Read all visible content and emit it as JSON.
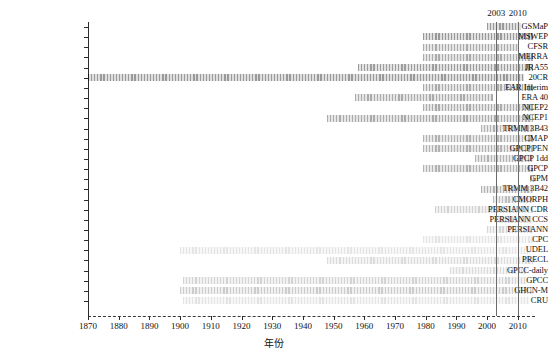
{
  "chart_data": {
    "type": "bar",
    "subtype": "gantt-timeline",
    "title": "",
    "xlabel": "年份",
    "ylabel": "",
    "xlim": [
      1870,
      2016
    ],
    "xticks": [
      1870,
      1880,
      1890,
      1900,
      1910,
      1920,
      1930,
      1940,
      1950,
      1960,
      1970,
      1980,
      1990,
      2000,
      2010
    ],
    "xticklabels": [
      "1870",
      "1880",
      "1890",
      "1900",
      "1910",
      "1920",
      "1930",
      "1940",
      "1950",
      "1960",
      "1970",
      "1980",
      "1990",
      "2000",
      "2010"
    ],
    "grid": false,
    "legend": null,
    "annotations": [
      {
        "label": "2003",
        "x": 2003,
        "type": "vertical-line"
      },
      {
        "label": "2010",
        "x": 2010,
        "type": "vertical-line"
      }
    ],
    "categories": [
      "GSMaP",
      "MSWEP",
      "CFSR",
      "MERRA",
      "JRA55",
      "20CR",
      "EAR Interim",
      "ERA 40",
      "NCEP2",
      "NCEP1",
      "TRMM 3B43",
      "CMAP",
      "GPCP PEN",
      "GPCP 1dd",
      "GPCP",
      "GPM",
      "TRMM 3B42",
      "CMORPH",
      "PERSIANN CDR",
      "PERSIANN CCS",
      "PERSIANN",
      "CPC",
      "UDEL",
      "PRECL",
      "GPCC-daily",
      "GPCC",
      "GHCN-M",
      "CRU"
    ],
    "bars": [
      {
        "name": "GSMaP",
        "start": 2000,
        "end": 2011,
        "shade": 0.4
      },
      {
        "name": "MSWEP",
        "start": 1979,
        "end": 2015,
        "shade": 0.4
      },
      {
        "name": "CFSR",
        "start": 1979,
        "end": 2010,
        "shade": 0.33
      },
      {
        "name": "MERRA",
        "start": 1979,
        "end": 2015,
        "shade": 0.33
      },
      {
        "name": "JRA55",
        "start": 1958,
        "end": 2015,
        "shade": 0.38
      },
      {
        "name": "20CR",
        "start": 1870,
        "end": 2012,
        "shade": 0.4
      },
      {
        "name": "EAR Interim",
        "start": 1979,
        "end": 2015,
        "shade": 0.33
      },
      {
        "name": "ERA 40",
        "start": 1957,
        "end": 2002,
        "shade": 0.33
      },
      {
        "name": "NCEP2",
        "start": 1979,
        "end": 2015,
        "shade": 0.33
      },
      {
        "name": "NCEP1",
        "start": 1948,
        "end": 2015,
        "shade": 0.33
      },
      {
        "name": "TRMM 3B43",
        "start": 1998,
        "end": 2015,
        "shade": 0.3
      },
      {
        "name": "CMAP",
        "start": 1979,
        "end": 2015,
        "shade": 0.3
      },
      {
        "name": "GPCP PEN",
        "start": 1979,
        "end": 2015,
        "shade": 0.3
      },
      {
        "name": "GPCP 1dd",
        "start": 1996,
        "end": 2015,
        "shade": 0.3
      },
      {
        "name": "GPCP",
        "start": 1979,
        "end": 2015,
        "shade": 0.3
      },
      {
        "name": "GPM",
        "start": 2014,
        "end": 2016,
        "shade": 0.3
      },
      {
        "name": "TRMM 3B42",
        "start": 1998,
        "end": 2015,
        "shade": 0.3
      },
      {
        "name": "CMORPH",
        "start": 2002,
        "end": 2015,
        "shade": 0.26
      },
      {
        "name": "PERSIANN CDR",
        "start": 1983,
        "end": 2015,
        "shade": 0.18
      },
      {
        "name": "PERSIANN CCS",
        "start": 2003,
        "end": 2015,
        "shade": 0.16
      },
      {
        "name": "PERSIANN",
        "start": 2000,
        "end": 2015,
        "shade": 0.16
      },
      {
        "name": "CPC",
        "start": 1979,
        "end": 2015,
        "shade": 0.1
      },
      {
        "name": "UDEL",
        "start": 1900,
        "end": 2014,
        "shade": 0.1
      },
      {
        "name": "PRECL",
        "start": 1948,
        "end": 2015,
        "shade": 0.14
      },
      {
        "name": "GPCC-daily",
        "start": 1988,
        "end": 2013,
        "shade": 0.14
      },
      {
        "name": "GPCC",
        "start": 1901,
        "end": 2013,
        "shade": 0.17
      },
      {
        "name": "GHCN-M",
        "start": 1900,
        "end": 2015,
        "shade": 0.2
      },
      {
        "name": "CRU",
        "start": 1901,
        "end": 2014,
        "shade": 0.11
      }
    ]
  }
}
